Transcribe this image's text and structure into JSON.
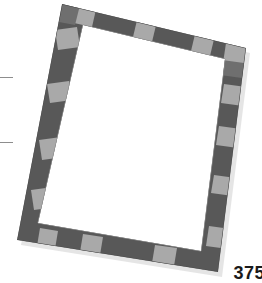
{
  "page": {
    "width": 262,
    "height": 283,
    "background_color": "#ffffff",
    "page_number": "375"
  },
  "margin_marks": {
    "name": "crop-tick-marks",
    "color": "#8d8d8d",
    "items": [
      {
        "label": "upper-left-tick",
        "x": 0,
        "y": 77,
        "length": 13
      },
      {
        "label": "lower-left-tick",
        "x": 0,
        "y": 142,
        "length": 13
      }
    ]
  },
  "artwork": {
    "name": "checkered-picture-frame",
    "description": "Rotated rectangular frame border with alternating light and dark gray segments around an empty white mat",
    "rotation_degrees": -10,
    "border_thickness_px": 21,
    "colors": {
      "dark_gray": "#585858",
      "light_gray": "#a9a9a9",
      "mid_gray": "#767676",
      "inner_fill": "#ffffff",
      "shadow": "#c9c9c9"
    },
    "corners": {
      "top_left": [
        62,
        4
      ],
      "top_right": [
        246,
        48
      ],
      "bottom_right": [
        218,
        272
      ],
      "bottom_left": [
        17,
        240
      ]
    },
    "segments": {
      "top": [
        "dark",
        "light",
        "dark",
        "dark",
        "light",
        "dark",
        "dark",
        "light",
        "dark"
      ],
      "right": [
        "light",
        "dark",
        "light",
        "dark",
        "dark",
        "light",
        "dark",
        "dark",
        "light",
        "dark"
      ],
      "bottom": [
        "dark",
        "light",
        "dark",
        "light",
        "dark",
        "dark",
        "light",
        "dark"
      ],
      "left": [
        "dark",
        "light",
        "dark",
        "dark",
        "light",
        "dark",
        "light",
        "dark"
      ]
    }
  }
}
